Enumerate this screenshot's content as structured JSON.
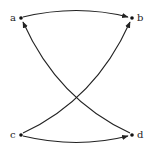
{
  "diagram": {
    "type": "directed-graph",
    "nodes": [
      {
        "id": "a",
        "label": "a",
        "x": 21,
        "y": 18
      },
      {
        "id": "b",
        "label": "b",
        "x": 132,
        "y": 18
      },
      {
        "id": "c",
        "label": "c",
        "x": 21,
        "y": 135
      },
      {
        "id": "d",
        "label": "d",
        "x": 132,
        "y": 135
      }
    ],
    "edges": [
      {
        "from": "a",
        "to": "b"
      },
      {
        "from": "c",
        "to": "d"
      },
      {
        "from": "c",
        "to": "b"
      },
      {
        "from": "d",
        "to": "a"
      }
    ],
    "colors": {
      "edge": "#222222",
      "node": "#111111",
      "background": "#ffffff"
    }
  }
}
